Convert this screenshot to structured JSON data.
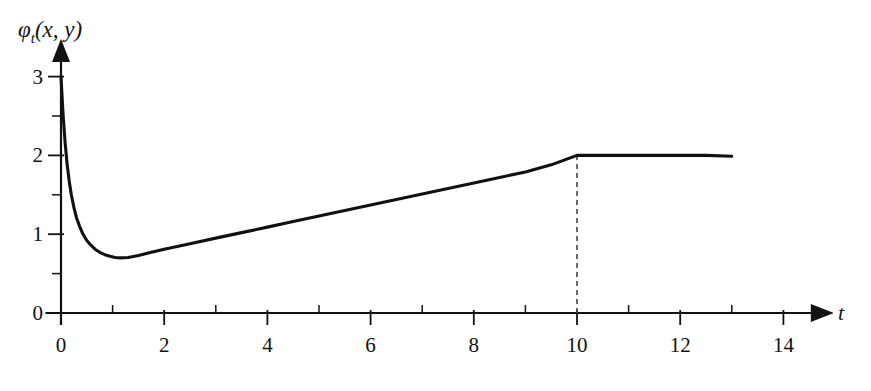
{
  "chart_data": {
    "type": "line",
    "title": "",
    "subtitle": "",
    "ylabel": "φ_t(x, y)",
    "ylabel_parts": {
      "symbol": "φ",
      "subscript": "t",
      "args": "(x, y)"
    },
    "xlabel": "t",
    "xlim": [
      -0.3,
      14.9
    ],
    "ylim": [
      0,
      3.35
    ],
    "grid": false,
    "legend": null,
    "x_ticks_major": [
      0,
      2,
      4,
      6,
      8,
      10,
      12,
      14
    ],
    "x_tick_labels": [
      "0",
      "2",
      "4",
      "6",
      "8",
      "10",
      "12",
      "14"
    ],
    "x_ticks_minor": [
      1,
      3,
      5,
      7,
      9,
      11,
      13
    ],
    "y_ticks_major": [
      0,
      1,
      2,
      3
    ],
    "y_tick_labels": [
      "0",
      "1",
      "2",
      "3"
    ],
    "y_ticks_minor": [
      0.5,
      1.5,
      2.5
    ],
    "series": [
      {
        "name": "phi_t",
        "color": "#111111",
        "x": [
          0.0,
          0.04,
          0.08,
          0.12,
          0.16,
          0.2,
          0.25,
          0.3,
          0.36,
          0.42,
          0.5,
          0.58,
          0.66,
          0.75,
          0.85,
          0.95,
          1.05,
          1.15,
          1.3,
          1.5,
          1.75,
          2.0,
          2.5,
          3.0,
          3.5,
          4.0,
          4.5,
          5.0,
          5.5,
          6.0,
          6.5,
          7.0,
          7.5,
          8.0,
          8.5,
          9.0,
          9.5,
          10.0,
          10.5,
          11.0,
          11.5,
          12.0,
          12.5,
          13.0
        ],
        "y": [
          3.0,
          2.52,
          2.16,
          1.88,
          1.67,
          1.5,
          1.34,
          1.21,
          1.1,
          1.01,
          0.92,
          0.86,
          0.81,
          0.77,
          0.74,
          0.72,
          0.705,
          0.7,
          0.705,
          0.73,
          0.77,
          0.81,
          0.88,
          0.95,
          1.02,
          1.09,
          1.16,
          1.23,
          1.3,
          1.37,
          1.44,
          1.51,
          1.58,
          1.65,
          1.72,
          1.79,
          1.88,
          2.0,
          2.0,
          2.0,
          2.0,
          2.0,
          2.0,
          1.99
        ]
      }
    ],
    "annotations": [
      {
        "name": "kink-marker",
        "type": "dashed-vertical-line",
        "x": 10,
        "y_from": 0,
        "y_to": 2.0,
        "style": "dashed",
        "color": "#444444"
      }
    ],
    "axes_style": {
      "arrow_heads": true,
      "x_axis_arrow_label": "t",
      "spine_color": "#111111"
    },
    "key_points": {
      "start_value": 3.0,
      "minimum_t": 1.1,
      "minimum_value": 0.7,
      "plateau_start_t": 10,
      "plateau_value": 2.0,
      "curve_end_t": 13
    }
  }
}
